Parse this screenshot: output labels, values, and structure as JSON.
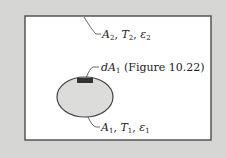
{
  "diagram": {
    "enclosure_label": {
      "a": "A",
      "a_sub": "2",
      "t": "T",
      "t_sub": "2",
      "e": "ε",
      "e_sub": "2"
    },
    "element_label": {
      "d": "dA",
      "d_sub": "1",
      "ref": "(Figure 10.22)"
    },
    "body_label": {
      "a": "A",
      "a_sub": "1",
      "t": "T",
      "t_sub": "1",
      "e": "ε",
      "e_sub": "1"
    },
    "colors": {
      "background": "#d6d6d4",
      "frame": "#555555",
      "body_fill": "#dcdcda",
      "element_patch": "#333333"
    }
  }
}
